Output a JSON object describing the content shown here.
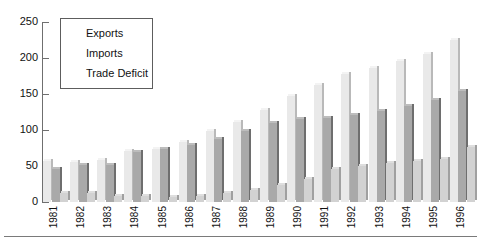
{
  "chart_data": {
    "type": "bar",
    "title": "",
    "xlabel": "",
    "ylabel": "",
    "ylim": [
      0,
      250
    ],
    "yticks": [
      0,
      50,
      100,
      150,
      200,
      250
    ],
    "grid": false,
    "legend_position": "upper-left",
    "categories": [
      "1981",
      "1982",
      "1983",
      "1984",
      "1985",
      "1986",
      "1987",
      "1988",
      "1989",
      "1990",
      "1991",
      "1992",
      "1993",
      "1994",
      "1995",
      "1996"
    ],
    "series": [
      {
        "name": "Exports",
        "values": [
          57,
          56,
          58,
          71,
          74,
          83,
          98,
          111,
          128,
          147,
          163,
          178,
          186,
          196,
          206,
          225
        ]
      },
      {
        "name": "Imports",
        "values": [
          46,
          51,
          51,
          69,
          73,
          79,
          88,
          98,
          110,
          115,
          116,
          121,
          127,
          133,
          142,
          154
        ]
      },
      {
        "name": "Trade Deficit",
        "values": [
          12,
          13,
          9,
          8,
          7,
          9,
          12,
          16,
          23,
          32,
          46,
          50,
          54,
          57,
          60,
          76
        ]
      }
    ]
  },
  "axis": {
    "y_tick_labels": [
      "250",
      "200",
      "150",
      "100",
      "50",
      "0"
    ]
  },
  "legend": {
    "items": [
      {
        "label": "Exports"
      },
      {
        "label": "Imports"
      },
      {
        "label": "Trade Deficit"
      }
    ]
  },
  "colors": {
    "exports": "#e9e9e9",
    "imports": "#a9a9a9",
    "trade_deficit": "#d2d2d2",
    "axis": "#6f6f6f",
    "text": "#111111"
  }
}
